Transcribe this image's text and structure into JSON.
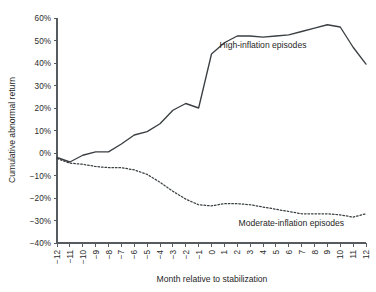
{
  "chart_data": {
    "type": "line",
    "title": "",
    "xlabel": "Month relative to stabilization",
    "ylabel": "Cumulative abnormal return",
    "x": [
      -12,
      -11,
      -10,
      -9,
      -8,
      -7,
      -6,
      -5,
      -4,
      -3,
      -2,
      -1,
      0,
      1,
      2,
      3,
      4,
      5,
      6,
      7,
      8,
      9,
      10,
      11,
      12
    ],
    "xlim": [
      -12,
      12
    ],
    "ylim": [
      -40,
      60
    ],
    "yticks": [
      60,
      50,
      40,
      30,
      20,
      10,
      0,
      -10,
      -20,
      -30,
      -40
    ],
    "ytick_labels": [
      "60%",
      "50%",
      "40%",
      "30%",
      "20%",
      "10%",
      "0%",
      "−10%",
      "−20%",
      "−30%",
      "−40%"
    ],
    "xtick_labels": [
      "−12",
      "−11",
      "−10",
      "−9",
      "−8",
      "−7",
      "−6",
      "−5",
      "−4",
      "−3",
      "−2",
      "−1",
      "0",
      "1",
      "2",
      "3",
      "4",
      "5",
      "6",
      "7",
      "8",
      "9",
      "10",
      "11",
      "12"
    ],
    "grid": false,
    "legend_position": "inline-annotation",
    "series": [
      {
        "name": "High-inflation episodes",
        "style": "solid",
        "color": "#3a3f42",
        "values": [
          -2,
          -4,
          -1,
          0.5,
          0.5,
          4,
          8,
          9.5,
          13,
          19,
          22,
          20,
          44,
          49,
          52,
          52,
          51.5,
          52,
          52.5,
          54,
          55.5,
          57,
          56,
          47,
          39.5
        ]
      },
      {
        "name": "Moderate-inflation episodes",
        "style": "dotted",
        "color": "#3a3f42",
        "values": [
          -2.5,
          -4.5,
          -5,
          -6,
          -6.5,
          -6.5,
          -7.5,
          -9.5,
          -13,
          -17,
          -20.5,
          -23,
          -23.5,
          -22.5,
          -22.5,
          -23,
          -24,
          -25,
          -26,
          -27,
          -27,
          -27,
          -27.5,
          -28.5,
          -27
        ]
      }
    ],
    "annotations": [
      {
        "text": "High-inflation episodes",
        "x": 4.0,
        "y": 46.5
      },
      {
        "text": "Moderate-inflation episodes",
        "x": 6.2,
        "y": -32.5
      }
    ]
  },
  "colors": {
    "axis": "#555b5e",
    "line": "#3a3f42",
    "text": "#1f1f1f",
    "background": "#ffffff"
  }
}
